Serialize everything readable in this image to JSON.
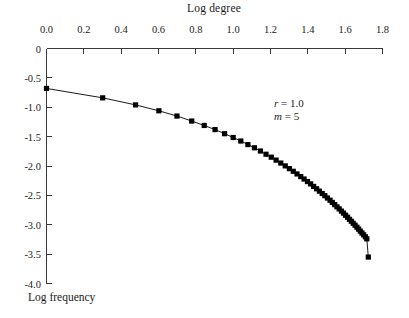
{
  "chart_data": {
    "type": "scatter",
    "title": "Log degree",
    "xlabel": "Log degree",
    "ylabel": "Log frequency",
    "xlim": [
      0.0,
      1.8
    ],
    "ylim": [
      -4.0,
      0.0
    ],
    "x_axis_position": "top",
    "y_axis_position": "left",
    "grid": false,
    "legend": null,
    "xticks": [
      "0.0",
      "0.2",
      "0.4",
      "0.6",
      "0.8",
      "1.0",
      "1.2",
      "1.4",
      "1.6",
      "1.8"
    ],
    "xtick_values": [
      0.0,
      0.2,
      0.4,
      0.6,
      0.8,
      1.0,
      1.2,
      1.4,
      1.6,
      1.8
    ],
    "yticks": [
      "0",
      "-0.5",
      "-1.0",
      "-1.5",
      "-2.0",
      "-2.5",
      "-3.0",
      "-3.5",
      "-4.0"
    ],
    "ytick_values": [
      0,
      -0.5,
      -1.0,
      -1.5,
      -2.0,
      -2.5,
      -3.0,
      -3.5,
      -4.0
    ],
    "marker": "square",
    "marker_color": "#000000",
    "line_color": "#000000",
    "series": [
      {
        "name": "degree distribution",
        "x": [
          0.0,
          0.301,
          0.477,
          0.602,
          0.699,
          0.778,
          0.845,
          0.903,
          0.954,
          1.0,
          1.041,
          1.079,
          1.114,
          1.146,
          1.176,
          1.204,
          1.23,
          1.255,
          1.279,
          1.301,
          1.322,
          1.342,
          1.362,
          1.38,
          1.398,
          1.415,
          1.431,
          1.447,
          1.462,
          1.477,
          1.491,
          1.505,
          1.519,
          1.531,
          1.544,
          1.556,
          1.568,
          1.58,
          1.591,
          1.602,
          1.613,
          1.623,
          1.633,
          1.643,
          1.653,
          1.663,
          1.672,
          1.681,
          1.69,
          1.699,
          1.708,
          1.716,
          1.724
        ],
        "y": [
          -0.68,
          -0.84,
          -0.96,
          -1.06,
          -1.15,
          -1.235,
          -1.31,
          -1.38,
          -1.45,
          -1.515,
          -1.575,
          -1.635,
          -1.69,
          -1.745,
          -1.8,
          -1.85,
          -1.9,
          -1.95,
          -1.998,
          -2.045,
          -2.09,
          -2.135,
          -2.18,
          -2.222,
          -2.265,
          -2.305,
          -2.348,
          -2.388,
          -2.428,
          -2.468,
          -2.505,
          -2.545,
          -2.583,
          -2.62,
          -2.658,
          -2.695,
          -2.73,
          -2.768,
          -2.802,
          -2.838,
          -2.872,
          -2.908,
          -2.94,
          -2.975,
          -3.008,
          -3.042,
          -3.075,
          -3.108,
          -3.14,
          -3.172,
          -3.205,
          -3.24,
          -3.55
        ]
      }
    ],
    "annotations": [
      {
        "id": "annot-r",
        "symbol": "r",
        "equals": " = ",
        "value": "1.0"
      },
      {
        "id": "annot-m",
        "symbol": "m",
        "equals": " = ",
        "value": "5"
      }
    ]
  },
  "axes": {
    "title_text": "Log degree",
    "ylabel_text": "Log frequency"
  }
}
